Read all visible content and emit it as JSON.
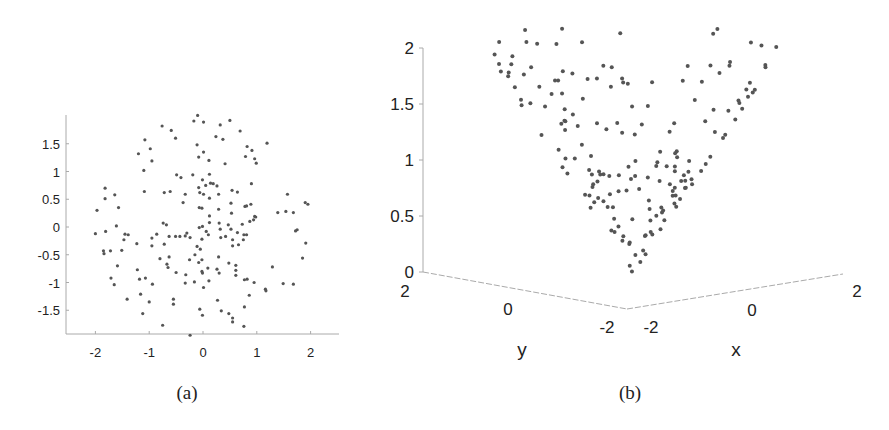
{
  "chart_data": [
    {
      "id": "a",
      "type": "scatter",
      "caption": "(a)",
      "title": "",
      "xlabel": "",
      "ylabel": "",
      "xlim": [
        -2.5,
        2.5
      ],
      "ylim": [
        -1.95,
        1.95
      ],
      "xticks": [
        -2,
        -1,
        0,
        1,
        2
      ],
      "xtick_labels": [
        "-2",
        "-1",
        "0",
        "1",
        "2"
      ],
      "yticks": [
        1.5,
        1,
        0.5,
        0,
        -0.5,
        -1,
        -1.5
      ],
      "ytick_labels": [
        "1.5",
        "1",
        "0.5",
        "0",
        "-0.5",
        "-1",
        "-1.5"
      ],
      "grid": false,
      "points": [
        [
          -0.1,
          2.01
        ],
        [
          -0.17,
          1.91
        ],
        [
          0.01,
          1.89
        ],
        [
          0.32,
          1.84
        ],
        [
          0.5,
          1.92
        ],
        [
          -0.76,
          1.82
        ],
        [
          -0.59,
          1.74
        ],
        [
          -0.51,
          1.6
        ],
        [
          0.69,
          1.73
        ],
        [
          0.24,
          1.63
        ],
        [
          0.37,
          1.58
        ],
        [
          -1.08,
          1.57
        ],
        [
          -0.11,
          1.48
        ],
        [
          0.01,
          1.35
        ],
        [
          -0.98,
          1.41
        ],
        [
          -1.2,
          1.32
        ],
        [
          -0.95,
          1.19
        ],
        [
          -0.08,
          1.26
        ],
        [
          0.11,
          1.2
        ],
        [
          0.41,
          1.14
        ],
        [
          0.82,
          1.45
        ],
        [
          0.91,
          1.38
        ],
        [
          0.96,
          1.23
        ],
        [
          1.19,
          1.51
        ],
        [
          0.79,
          1.27
        ],
        [
          0.99,
          1.15
        ],
        [
          -1.1,
          1.02
        ],
        [
          -0.49,
          0.94
        ],
        [
          -0.41,
          0.89
        ],
        [
          -0.19,
          0.94
        ],
        [
          0.12,
          0.95
        ],
        [
          -0.01,
          0.85
        ],
        [
          0.14,
          0.79
        ],
        [
          0.05,
          0.75
        ],
        [
          0.19,
          0.78
        ],
        [
          0.26,
          0.74
        ],
        [
          -0.08,
          0.71
        ],
        [
          -0.06,
          0.62
        ],
        [
          0.01,
          0.59
        ],
        [
          0.12,
          0.52
        ],
        [
          0.29,
          0.59
        ],
        [
          0.54,
          0.66
        ],
        [
          0.64,
          0.63
        ],
        [
          0.9,
          0.78
        ],
        [
          -1.09,
          0.64
        ],
        [
          -0.72,
          0.62
        ],
        [
          -0.61,
          0.64
        ],
        [
          -1.82,
          0.7
        ],
        [
          -1.82,
          0.51
        ],
        [
          -1.64,
          0.58
        ],
        [
          -1.57,
          0.35
        ],
        [
          -1.97,
          0.3
        ],
        [
          -0.33,
          0.59
        ],
        [
          -0.37,
          0.44
        ],
        [
          -0.07,
          0.35
        ],
        [
          -0.02,
          0.34
        ],
        [
          0.12,
          0.2
        ],
        [
          0.29,
          0.32
        ],
        [
          0.52,
          0.43
        ],
        [
          0.53,
          0.25
        ],
        [
          0.78,
          0.37
        ],
        [
          0.81,
          0.38
        ],
        [
          0.89,
          0.41
        ],
        [
          0.98,
          0.18
        ],
        [
          0.94,
          0.13
        ],
        [
          0.87,
          0.1
        ],
        [
          1.39,
          0.26
        ],
        [
          1.54,
          0.28
        ],
        [
          1.57,
          0.59
        ],
        [
          1.68,
          0.26
        ],
        [
          1.9,
          0.44
        ],
        [
          1.95,
          0.41
        ],
        [
          -2.0,
          -0.12
        ],
        [
          -1.81,
          -0.08
        ],
        [
          -1.61,
          0.02
        ],
        [
          -1.45,
          -0.13
        ],
        [
          -1.39,
          -0.14
        ],
        [
          -1.47,
          -0.23
        ],
        [
          -1.23,
          -0.3
        ],
        [
          -0.95,
          -0.2
        ],
        [
          -0.86,
          -0.13
        ],
        [
          -0.95,
          -0.34
        ],
        [
          -0.74,
          0.07
        ],
        [
          -0.68,
          0.04
        ],
        [
          -0.72,
          -0.31
        ],
        [
          -0.63,
          -0.17
        ],
        [
          -0.51,
          -0.17
        ],
        [
          -0.43,
          -0.17
        ],
        [
          -0.33,
          -0.16
        ],
        [
          -0.3,
          -0.11
        ],
        [
          -0.24,
          -0.19
        ],
        [
          -0.07,
          -0.01
        ],
        [
          -0.01,
          0.01
        ],
        [
          -0.02,
          -0.22
        ],
        [
          0.06,
          -0.08
        ],
        [
          0.1,
          -0.14
        ],
        [
          0.12,
          0.08
        ],
        [
          0.3,
          0.07
        ],
        [
          0.32,
          -0.04
        ],
        [
          0.33,
          -0.19
        ],
        [
          0.42,
          -0.17
        ],
        [
          0.47,
          0.04
        ],
        [
          0.52,
          -0.04
        ],
        [
          0.55,
          -0.23
        ],
        [
          0.55,
          -0.34
        ],
        [
          0.64,
          -0.1
        ],
        [
          0.66,
          -0.32
        ],
        [
          0.73,
          0.05
        ],
        [
          0.76,
          -0.14
        ],
        [
          0.75,
          -0.23
        ],
        [
          0.81,
          -0.14
        ],
        [
          0.96,
          0.19
        ],
        [
          1.72,
          -0.07
        ],
        [
          1.75,
          -0.05
        ],
        [
          1.91,
          -0.29
        ],
        [
          1.85,
          -0.56
        ],
        [
          -1.85,
          -0.43
        ],
        [
          -1.84,
          -0.48
        ],
        [
          -1.72,
          -0.43
        ],
        [
          -1.51,
          -0.42
        ],
        [
          -1.59,
          -0.7
        ],
        [
          -1.71,
          -0.92
        ],
        [
          -1.65,
          -1.04
        ],
        [
          -1.22,
          -0.77
        ],
        [
          -1.18,
          -0.94
        ],
        [
          -1.07,
          -0.92
        ],
        [
          -0.94,
          -1.03
        ],
        [
          -1.16,
          -1.21
        ],
        [
          -1.41,
          -1.3
        ],
        [
          -1.12,
          -1.56
        ],
        [
          -1.0,
          -1.35
        ],
        [
          -0.55,
          -1.3
        ],
        [
          -0.55,
          -1.39
        ],
        [
          -0.8,
          -0.57
        ],
        [
          -0.67,
          -0.67
        ],
        [
          -0.65,
          -0.73
        ],
        [
          -0.63,
          -0.54
        ],
        [
          -0.5,
          -0.82
        ],
        [
          -0.32,
          -0.86
        ],
        [
          -0.33,
          -1.01
        ],
        [
          -0.25,
          -0.59
        ],
        [
          -0.15,
          -0.5
        ],
        [
          -0.11,
          -0.35
        ],
        [
          -0.05,
          -0.4
        ],
        [
          -0.16,
          -0.99
        ],
        [
          -0.08,
          -0.64
        ],
        [
          -0.02,
          -0.59
        ],
        [
          -0.01,
          -0.83
        ],
        [
          -0.02,
          -0.8
        ],
        [
          0.01,
          -1.09
        ],
        [
          0.09,
          -0.74
        ],
        [
          0.11,
          -0.97
        ],
        [
          0.26,
          -0.76
        ],
        [
          0.3,
          -0.83
        ],
        [
          0.29,
          -0.54
        ],
        [
          0.48,
          -0.65
        ],
        [
          0.61,
          -0.69
        ],
        [
          0.61,
          -0.78
        ],
        [
          0.61,
          -0.87
        ],
        [
          0.77,
          -0.95
        ],
        [
          0.82,
          -0.94
        ],
        [
          0.95,
          -1.0
        ],
        [
          0.86,
          -1.23
        ],
        [
          1.16,
          -1.12
        ],
        [
          1.17,
          -1.15
        ],
        [
          1.29,
          -0.72
        ],
        [
          1.49,
          -1.02
        ],
        [
          1.68,
          -1.03
        ],
        [
          0.27,
          -1.32
        ],
        [
          0.34,
          -1.51
        ],
        [
          0.48,
          -1.56
        ],
        [
          0.55,
          -1.64
        ],
        [
          0.55,
          -1.71
        ],
        [
          0.77,
          -1.44
        ],
        [
          0.76,
          -1.79
        ],
        [
          -0.06,
          -1.48
        ],
        [
          -0.01,
          -1.59
        ],
        [
          -0.75,
          -1.77
        ],
        [
          -0.24,
          -1.95
        ]
      ]
    },
    {
      "id": "b",
      "type": "scatter3d",
      "caption": "(b)",
      "title": "",
      "xlabel": "x",
      "ylabel": "y",
      "zlabel": "",
      "xlim": [
        -2,
        2
      ],
      "ylim": [
        -2,
        2
      ],
      "zlim": [
        0,
        2
      ],
      "xtick_labels": [
        "-2",
        "0",
        "2"
      ],
      "ytick_labels": [
        "2",
        "0",
        "-2"
      ],
      "ztick_labels": [
        "0",
        "0.5",
        "1",
        "1.5",
        "2"
      ],
      "zticks": [
        0,
        0.5,
        1,
        1.5,
        2
      ],
      "grid": false,
      "points_source": "same (x, y) points as plot (a), lifted onto the cone",
      "z_rule": "z = sqrt(x^2 + y^2)"
    }
  ]
}
